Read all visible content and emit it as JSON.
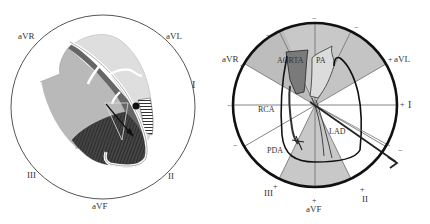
{
  "left_panel": {
    "leads": {
      "aVR": "aVR",
      "aVL": "aVL",
      "I": "I",
      "II": "II",
      "III": "III",
      "aVF": "aVF"
    }
  },
  "right_panel": {
    "leads": {
      "aVR": "aVR",
      "aVL": "aVL",
      "I": "I",
      "II": "II",
      "III": "III",
      "aVF": "aVF"
    },
    "polarity": {
      "plus": "+",
      "minus": "−"
    },
    "structures": {
      "aorta": "AORTA",
      "pa": "PA",
      "rca": "RCA",
      "pda": "PDA",
      "lad": "LAD"
    }
  },
  "colors": {
    "shaded_sector": "#c8c8c8",
    "aorta_fill": "#7a7a7a",
    "pa_fill": "#dcdcdc",
    "outline": "#111111"
  }
}
